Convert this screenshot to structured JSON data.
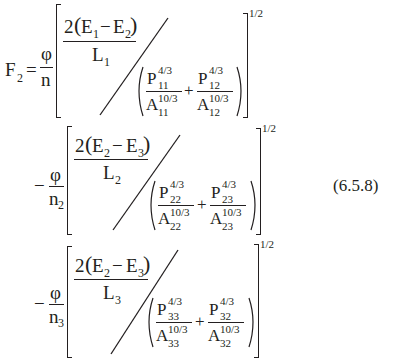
{
  "equation": {
    "number": "(6.5.8)",
    "lhs": {
      "symbol": "F",
      "subscript": "2",
      "equals": "="
    },
    "outer_exponent": "1/2",
    "terms": [
      {
        "sign": "",
        "prefactor": {
          "numerator": "φ",
          "denominator": "n",
          "denominator_sub": ""
        },
        "top_fraction": {
          "coef": "2",
          "open": "(",
          "e_a": "E",
          "e_a_sub": "1",
          "minus": "−",
          "e_b": "E",
          "e_b_sub": "2",
          "close": ")",
          "den": "L",
          "den_sub": "1"
        },
        "bottom_sum": [
          {
            "num": "P",
            "num_sub": "11",
            "num_exp": "4/3",
            "den": "A",
            "den_sub": "11",
            "den_exp": "10/3"
          },
          {
            "num": "P",
            "num_sub": "12",
            "num_exp": "4/3",
            "den": "A",
            "den_sub": "12",
            "den_exp": "10/3"
          }
        ],
        "plus": "+"
      },
      {
        "sign": "−",
        "prefactor": {
          "numerator": "φ",
          "denominator": "n",
          "denominator_sub": "2"
        },
        "top_fraction": {
          "coef": "2",
          "open": "(",
          "e_a": "E",
          "e_a_sub": "2",
          "minus": "−",
          "e_b": "E",
          "e_b_sub": "3",
          "close": ")",
          "den": "L",
          "den_sub": "2"
        },
        "bottom_sum": [
          {
            "num": "P",
            "num_sub": "22",
            "num_exp": "4/3",
            "den": "A",
            "den_sub": "22",
            "den_exp": "10/3"
          },
          {
            "num": "P",
            "num_sub": "23",
            "num_exp": "4/3",
            "den": "A",
            "den_sub": "23",
            "den_exp": "10/3"
          }
        ],
        "plus": "+"
      },
      {
        "sign": "−",
        "prefactor": {
          "numerator": "φ",
          "denominator": "n",
          "denominator_sub": "3"
        },
        "top_fraction": {
          "coef": "2",
          "open": "(",
          "e_a": "E",
          "e_a_sub": "2",
          "minus": "−",
          "e_b": "E",
          "e_b_sub": "3",
          "close": ")",
          "den": "L",
          "den_sub": "3"
        },
        "bottom_sum": [
          {
            "num": "P",
            "num_sub": "33",
            "num_exp": "4/3",
            "den": "A",
            "den_sub": "33",
            "den_exp": "10/3"
          },
          {
            "num": "P",
            "num_sub": "32",
            "num_exp": "4/3",
            "den": "A",
            "den_sub": "32",
            "den_exp": "10/3"
          }
        ],
        "plus": "+"
      }
    ]
  }
}
